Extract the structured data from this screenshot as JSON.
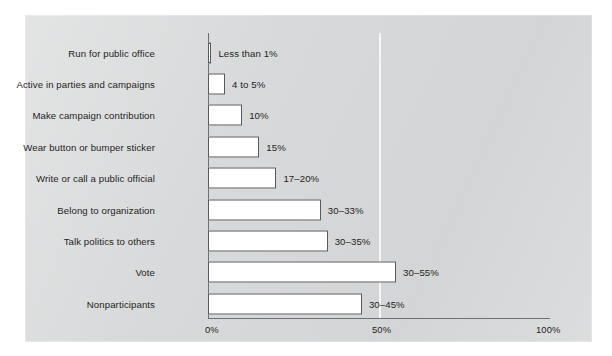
{
  "chart_data": {
    "type": "bar",
    "orientation": "horizontal",
    "title": "",
    "subtitle": "",
    "xlabel": "",
    "ylabel": "",
    "xlim": [
      0,
      100
    ],
    "xticks": [
      "0%",
      "50%",
      "100%"
    ],
    "xtick_values": [
      0,
      50,
      100
    ],
    "grid": "single vertical gridline at 50%",
    "legend": "none",
    "categories": [
      "Run for public office",
      "Active in parties and campaigns",
      "Make campaign contribution",
      "Wear button or bumper sticker",
      "Write or call a public official",
      "Belong to organization",
      "Talk politics to others",
      "Vote",
      "Nonparticipants"
    ],
    "values": [
      1,
      5,
      10,
      15,
      20,
      33,
      35,
      55,
      45
    ],
    "value_labels": [
      "Less than 1%",
      "4 to 5%",
      "10%",
      "15%",
      "17–20%",
      "30–33%",
      "30–35%",
      "30–55%",
      "30–45%"
    ],
    "bars": [
      {
        "category": "Run for public office",
        "value": 1,
        "label": "Less than 1%"
      },
      {
        "category": "Active in parties and campaigns",
        "value": 5,
        "label": "4 to 5%"
      },
      {
        "category": "Make campaign contribution",
        "value": 10,
        "label": "10%"
      },
      {
        "category": "Wear button or bumper sticker",
        "value": 15,
        "label": "15%"
      },
      {
        "category": "Write or call a public official",
        "value": 20,
        "label": "17–20%"
      },
      {
        "category": "Belong to organization",
        "value": 33,
        "label": "30–33%"
      },
      {
        "category": "Talk politics to others",
        "value": 35,
        "label": "30–35%"
      },
      {
        "category": "Vote",
        "value": 55,
        "label": "30–55%"
      },
      {
        "category": "Nonparticipants",
        "value": 45,
        "label": "30–45%"
      }
    ],
    "colors": {
      "panel_background": "#d7d8d9",
      "bar_fill": "#ffffff",
      "bar_border": "#58595b",
      "axis": "#6d6f70",
      "text": "#1d1f20",
      "gridline": "#ffffff",
      "page_background": "#ffffff"
    }
  }
}
